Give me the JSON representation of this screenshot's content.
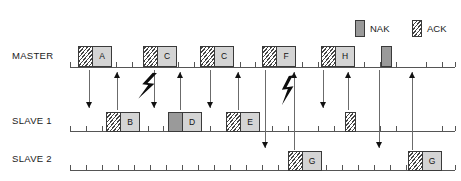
{
  "legend": {
    "items": [
      {
        "label": "NAK",
        "kind": "nak",
        "swatch_x": 355,
        "swatch_y": 20,
        "text_x": 370,
        "text_y": 24
      },
      {
        "label": "ACK",
        "kind": "ack",
        "swatch_x": 412,
        "swatch_y": 20,
        "text_x": 427,
        "text_y": 24
      }
    ]
  },
  "rows": [
    {
      "id": "master",
      "label": "MASTER",
      "label_x": 12,
      "label_y": 51,
      "axis_y": 67,
      "axis_x": 70,
      "axis_w": 385
    },
    {
      "id": "slave1",
      "label": "SLAVE 1",
      "label_x": 12,
      "label_y": 116,
      "axis_y": 131,
      "axis_x": 70,
      "axis_w": 385
    },
    {
      "id": "slave2",
      "label": "SLAVE 2",
      "label_x": 12,
      "label_y": 154,
      "axis_y": 170,
      "axis_x": 70,
      "axis_w": 385
    }
  ],
  "ticks": {
    "master": [
      70,
      86,
      116,
      132,
      148,
      178,
      194,
      210,
      240,
      255,
      272,
      302,
      318,
      334,
      364,
      380,
      396,
      426,
      442,
      455
    ],
    "slave1": [
      70,
      86,
      102,
      132,
      148,
      163,
      194,
      210,
      226,
      256,
      272,
      288,
      318,
      334,
      350,
      380,
      396,
      412,
      442,
      455
    ],
    "slave2": [
      70,
      86,
      102,
      118,
      134,
      150,
      166,
      182,
      198,
      214,
      230,
      246,
      262,
      278,
      294,
      310,
      326,
      342,
      358,
      374,
      390,
      406,
      422,
      438,
      455
    ]
  },
  "packets": {
    "master": [
      {
        "letter": "A",
        "flag": "ack",
        "x": 78,
        "y": 46,
        "w": 34,
        "h": 21,
        "flag_w": 14
      },
      {
        "letter": "C",
        "flag": "ack",
        "x": 143,
        "y": 46,
        "w": 34,
        "h": 21,
        "flag_w": 14
      },
      {
        "letter": "C",
        "flag": "ack",
        "x": 200,
        "y": 46,
        "w": 34,
        "h": 21,
        "flag_w": 14
      },
      {
        "letter": "F",
        "flag": "ack",
        "x": 262,
        "y": 46,
        "w": 34,
        "h": 21,
        "flag_w": 14
      },
      {
        "letter": "H",
        "flag": "ack",
        "x": 321,
        "y": 46,
        "w": 34,
        "h": 21,
        "flag_w": 14
      }
    ],
    "slave1": [
      {
        "letter": "B",
        "flag": "ack",
        "x": 106,
        "y": 112,
        "w": 34,
        "h": 20,
        "flag_w": 14
      },
      {
        "letter": "D",
        "flag": "nak",
        "x": 168,
        "y": 112,
        "w": 34,
        "h": 20,
        "flag_w": 14
      },
      {
        "letter": "E",
        "flag": "ack",
        "x": 226,
        "y": 112,
        "w": 34,
        "h": 20,
        "flag_w": 14
      }
    ],
    "slave2": [
      {
        "letter": "G",
        "flag": "ack",
        "x": 288,
        "y": 151,
        "w": 34,
        "h": 20,
        "flag_w": 14
      },
      {
        "letter": "G",
        "flag": "ack",
        "x": 408,
        "y": 151,
        "w": 34,
        "h": 20,
        "flag_w": 14
      }
    ]
  },
  "solo_boxes": [
    {
      "id": "master-nak",
      "kind": "nak",
      "x": 381,
      "y": 46,
      "w": 11,
      "h": 21
    },
    {
      "id": "slave1-ack",
      "kind": "ack",
      "x": 345,
      "y": 112,
      "w": 11,
      "h": 20
    }
  ],
  "arrows": [
    {
      "id": "m-to-s1-a",
      "x": 89,
      "y_top": 70,
      "y_bottom": 108,
      "dir": "down"
    },
    {
      "id": "s1-to-m-b",
      "x": 117,
      "y_top": 72,
      "y_bottom": 110,
      "dir": "up"
    },
    {
      "id": "m-to-s1-c1",
      "x": 154,
      "y_top": 70,
      "y_bottom": 108,
      "dir": "down"
    },
    {
      "id": "s1-to-m-d",
      "x": 180,
      "y_top": 72,
      "y_bottom": 110,
      "dir": "up"
    },
    {
      "id": "m-to-s1-c2",
      "x": 210,
      "y_top": 70,
      "y_bottom": 108,
      "dir": "down"
    },
    {
      "id": "s1-to-m-e",
      "x": 238,
      "y_top": 72,
      "y_bottom": 110,
      "dir": "up"
    },
    {
      "id": "m-to-s2-f",
      "x": 265,
      "y_top": 70,
      "y_bottom": 148,
      "dir": "down"
    },
    {
      "id": "s2-to-m-g1",
      "x": 294,
      "y_top": 72,
      "y_bottom": 150,
      "dir": "up"
    },
    {
      "id": "m-to-s1-h",
      "x": 323,
      "y_top": 70,
      "y_bottom": 108,
      "dir": "down"
    },
    {
      "id": "s1-to-m-ack",
      "x": 348,
      "y_top": 72,
      "y_bottom": 110,
      "dir": "up"
    },
    {
      "id": "m-to-s2-nak",
      "x": 379,
      "y_top": 70,
      "y_bottom": 148,
      "dir": "down"
    },
    {
      "id": "s2-to-m-g2",
      "x": 412,
      "y_top": 72,
      "y_bottom": 150,
      "dir": "up"
    }
  ],
  "bolts": [
    {
      "id": "bolt-corrupt-down",
      "x": 140,
      "y": 72,
      "dir": "down"
    },
    {
      "id": "bolt-corrupt-up",
      "x": 280,
      "y": 76,
      "dir": "up"
    }
  ]
}
